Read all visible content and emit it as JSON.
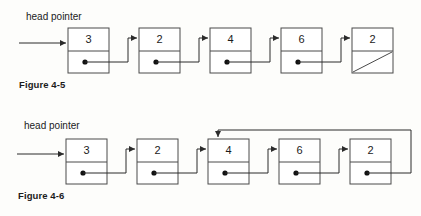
{
  "document": {
    "type": "linked-list-diagram",
    "background_color": "#fdfdfb",
    "line_color": "#2b2b2b",
    "box_stroke_color": "#4a4a4a",
    "text_color": "#1b1b1b"
  },
  "figures": [
    {
      "id": "figure-4-5",
      "caption": "Figure 4-5",
      "head_pointer_label": "head pointer",
      "list_type": "singly-linked-list-null-terminated",
      "nodes": [
        {
          "value": "3",
          "pointer": "next"
        },
        {
          "value": "2",
          "pointer": "next"
        },
        {
          "value": "4",
          "pointer": "next"
        },
        {
          "value": "6",
          "pointer": "next"
        },
        {
          "value": "2",
          "pointer": "null"
        }
      ]
    },
    {
      "id": "figure-4-6",
      "caption": "Figure 4-6",
      "head_pointer_label": "head pointer",
      "list_type": "linked-list-with-loop",
      "loop_target_value": "4",
      "nodes": [
        {
          "value": "3",
          "pointer": "next"
        },
        {
          "value": "2",
          "pointer": "next"
        },
        {
          "value": "4",
          "pointer": "next"
        },
        {
          "value": "6",
          "pointer": "next"
        },
        {
          "value": "2",
          "pointer": "loop-back-to-node-3"
        }
      ]
    }
  ]
}
